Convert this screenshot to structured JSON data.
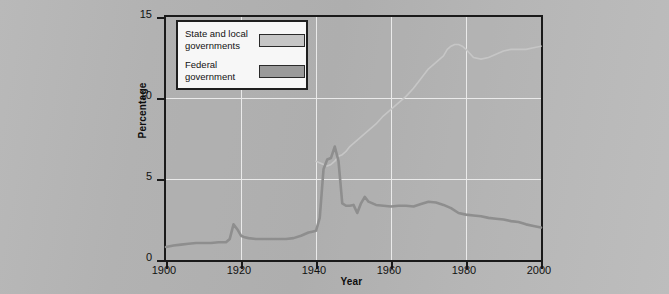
{
  "chart_data": {
    "type": "line",
    "title": "",
    "xlabel": "Year",
    "ylabel": "Percentage",
    "xlim": [
      1900,
      2000
    ],
    "ylim": [
      0,
      15
    ],
    "grid": true,
    "legend_position": "top-left",
    "xticks": [
      "1900",
      "1920",
      "1940",
      "1960",
      "1980",
      "2000"
    ],
    "xtick_values": [
      1900,
      1920,
      1940,
      1960,
      1980,
      2000
    ],
    "yticks": [
      "0",
      "5",
      "10",
      "15"
    ],
    "ytick_values": [
      0,
      5,
      10,
      15
    ],
    "series": [
      {
        "name": "State and local governments",
        "color": "#c6c6c6",
        "swatch_color": "#c6c6c6",
        "x": [
          1940,
          1942,
          1943,
          1944,
          1945,
          1946,
          1947,
          1948,
          1949,
          1950,
          1952,
          1954,
          1956,
          1958,
          1960,
          1962,
          1964,
          1966,
          1968,
          1970,
          1972,
          1974,
          1975,
          1976,
          1977,
          1978,
          1979,
          1980,
          1982,
          1984,
          1986,
          1988,
          1990,
          1992,
          1994,
          1996,
          1998,
          2000
        ],
        "values": [
          6.1,
          5.9,
          5.8,
          5.9,
          6.1,
          6.4,
          6.5,
          6.7,
          7.0,
          7.2,
          7.6,
          8.0,
          8.4,
          8.9,
          9.3,
          9.7,
          10.1,
          10.6,
          11.2,
          11.8,
          12.2,
          12.6,
          13.0,
          13.2,
          13.3,
          13.3,
          13.2,
          13.0,
          12.5,
          12.4,
          12.5,
          12.7,
          12.9,
          13.0,
          13.0,
          13.0,
          13.1,
          13.2
        ]
      },
      {
        "name": "Federal government",
        "color": "#8e8e8e",
        "swatch_color": "#9a9a9a",
        "x": [
          1900,
          1902,
          1904,
          1906,
          1908,
          1910,
          1912,
          1914,
          1916,
          1917,
          1918,
          1919,
          1920,
          1921,
          1922,
          1924,
          1926,
          1928,
          1930,
          1932,
          1934,
          1936,
          1938,
          1939,
          1940,
          1941,
          1942,
          1943,
          1944,
          1945,
          1946,
          1947,
          1948,
          1949,
          1950,
          1951,
          1952,
          1953,
          1954,
          1956,
          1958,
          1960,
          1962,
          1964,
          1966,
          1968,
          1970,
          1972,
          1974,
          1976,
          1978,
          1980,
          1982,
          1984,
          1986,
          1988,
          1990,
          1992,
          1994,
          1996,
          1998,
          2000
        ],
        "values": [
          0.8,
          0.9,
          0.95,
          1.0,
          1.05,
          1.05,
          1.05,
          1.1,
          1.1,
          1.3,
          2.2,
          1.9,
          1.5,
          1.4,
          1.35,
          1.3,
          1.3,
          1.3,
          1.3,
          1.3,
          1.35,
          1.5,
          1.7,
          1.75,
          1.8,
          2.6,
          5.6,
          6.2,
          6.3,
          7.0,
          6.1,
          3.5,
          3.35,
          3.35,
          3.4,
          2.9,
          3.5,
          3.9,
          3.6,
          3.4,
          3.35,
          3.3,
          3.35,
          3.35,
          3.3,
          3.45,
          3.6,
          3.55,
          3.4,
          3.2,
          2.9,
          2.8,
          2.75,
          2.7,
          2.6,
          2.55,
          2.5,
          2.4,
          2.35,
          2.2,
          2.1,
          2.0
        ]
      }
    ]
  },
  "legend": {
    "items": [
      {
        "label_line1": "State and local",
        "label_line2": "governments",
        "color": "#c6c6c6"
      },
      {
        "label_line1": "Federal",
        "label_line2": "government",
        "color": "#9a9a9a"
      }
    ]
  },
  "axes": {
    "x_title": "Year",
    "y_title": "Percentage"
  }
}
